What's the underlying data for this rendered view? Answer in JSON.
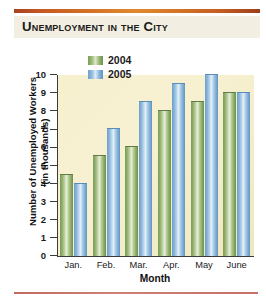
{
  "chart_title": "Unemployment in the City",
  "legend": {
    "position": "top-center-inside",
    "entries": [
      {
        "label": "2004",
        "color": "#8fae6b"
      },
      {
        "label": "2005",
        "color": "#84b2d8"
      }
    ]
  },
  "axes": {
    "y_title_line1": "Number of Unemployed Workers",
    "y_title_line2": "(in thousands)",
    "x_title": "Month",
    "y_ticks": [
      "10",
      "9",
      "8",
      "7",
      "6",
      "5",
      "4",
      "3",
      "2",
      "1",
      "0"
    ]
  },
  "colors": {
    "rule_top": "#c75a22",
    "rule_bottom": "#c5706a",
    "title_band": "#f2efe2",
    "plot_background": "#f6f0cf",
    "axis": "#3b3b3b",
    "series_2004": "#8fae6b",
    "series_2005": "#84b2d8"
  },
  "chart_data": {
    "type": "bar",
    "title": "Unemployment in the City",
    "xlabel": "Month",
    "ylabel": "Number of Unemployed Workers (in thousands)",
    "categories": [
      "Jan.",
      "Feb.",
      "Mar.",
      "Apr.",
      "May",
      "June"
    ],
    "series": [
      {
        "name": "2004",
        "color": "#8fae6b",
        "values": [
          4.5,
          5.5,
          6.0,
          8.0,
          8.5,
          9.0
        ]
      },
      {
        "name": "2005",
        "color": "#84b2d8",
        "values": [
          4.0,
          7.0,
          8.5,
          9.5,
          10.0,
          9.0
        ]
      }
    ],
    "ylim": [
      0,
      10
    ],
    "ytick_step": 1,
    "grid": false,
    "legend_position": "inside top center"
  }
}
